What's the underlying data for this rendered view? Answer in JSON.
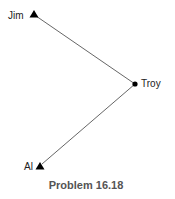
{
  "diagram": {
    "caption": "Problem 16.18",
    "nodes": [
      {
        "id": "jim",
        "label": "Jim",
        "shape": "triangle",
        "x": 34,
        "y": 14
      },
      {
        "id": "troy",
        "label": "Troy",
        "shape": "dot",
        "x": 135,
        "y": 84
      },
      {
        "id": "al",
        "label": "Al",
        "shape": "triangle",
        "x": 40,
        "y": 166
      }
    ],
    "edges": [
      {
        "from": "jim",
        "to": "troy"
      },
      {
        "from": "troy",
        "to": "al"
      }
    ],
    "colors": {
      "line": "#555555",
      "marker": "#000000",
      "caption": "#555555"
    }
  }
}
